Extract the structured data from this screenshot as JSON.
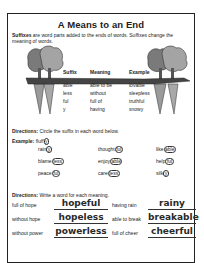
{
  "title": "A Means to an End",
  "intro": {
    "lead": "Suffixes",
    "text": " are word parts added to the ends of words. Suffixes change the meaning of words."
  },
  "table": {
    "headers": [
      "Suffix",
      "Meaning",
      "Example"
    ],
    "rows": [
      {
        "suffix": "able",
        "meaning": "able to be",
        "example": "lovable"
      },
      {
        "suffix": "less",
        "meaning": "without",
        "example": "sleepless"
      },
      {
        "suffix": "ful",
        "meaning": "full of",
        "example": "truthful"
      },
      {
        "suffix": "y",
        "meaning": "having",
        "example": "snowy"
      }
    ]
  },
  "directions1": {
    "label": "Directions:",
    "text": " Circle the suffix in each word below."
  },
  "example": {
    "label": "Example:",
    "stem": "fluff",
    "suffix": "y"
  },
  "circle_words": [
    {
      "stem": "rain",
      "suffix": "y"
    },
    {
      "stem": "thought",
      "suffix": "ful"
    },
    {
      "stem": "like",
      "suffix": "able"
    },
    {
      "stem": "blame",
      "suffix": "less"
    },
    {
      "stem": "enjoy",
      "suffix": "able"
    },
    {
      "stem": "help",
      "suffix": "ful"
    },
    {
      "stem": "peace",
      "suffix": "ful"
    },
    {
      "stem": "care",
      "suffix": "less"
    },
    {
      "stem": "silk",
      "suffix": "y"
    }
  ],
  "directions2": {
    "label": "Directions:",
    "text": " Write a word for each meaning."
  },
  "write_items": [
    {
      "meaning": "full of hope",
      "answer": "hopeful"
    },
    {
      "meaning": "having rain",
      "answer": "rainy"
    },
    {
      "meaning": "without hope",
      "answer": "hopeless"
    },
    {
      "meaning": "able to break",
      "answer": "breakable"
    },
    {
      "meaning": "without power",
      "answer": "powerless"
    },
    {
      "meaning": "full of cheer",
      "answer": "cheerful"
    }
  ]
}
